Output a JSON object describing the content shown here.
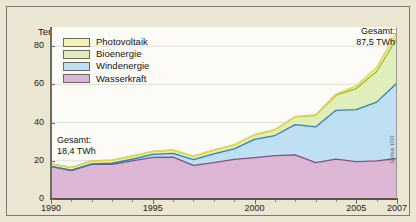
{
  "figure": {
    "axis_title": "Terawattstunden",
    "credit": "Globus 1093"
  },
  "legend": {
    "position": "top-left-inside",
    "items": [
      {
        "label": "Photovoltaik",
        "color": "#f4f2b0"
      },
      {
        "label": "Bioenergie",
        "color": "#e0eebb"
      },
      {
        "label": "Windenergie",
        "color": "#bfe0f2"
      },
      {
        "label": "Wasserkraft",
        "color": "#dcb6d4"
      }
    ]
  },
  "annotations": [
    {
      "name": "start-total",
      "text": "Gesamt:\n18,4 TWh",
      "year": 1990,
      "value": 18.4
    },
    {
      "name": "end-total",
      "text": "Gesamt:\n87,5 TWh",
      "year": 2007,
      "value": 87.5
    }
  ],
  "chart_data": {
    "type": "area",
    "stacked": true,
    "title": "",
    "subtitle": "",
    "xlabel": "",
    "ylabel": "Terawattstunden",
    "xlim": [
      1990,
      2007
    ],
    "ylim": [
      0,
      90
    ],
    "grid": true,
    "yticks": [
      0,
      20,
      40,
      60,
      80
    ],
    "xticks": [
      1990,
      1995,
      2000,
      2005,
      2007
    ],
    "x": [
      1990,
      1991,
      1992,
      1993,
      1994,
      1995,
      1996,
      1997,
      1998,
      1999,
      2000,
      2001,
      2002,
      2003,
      2004,
      2005,
      2006,
      2007
    ],
    "series": [
      {
        "name": "Wasserkraft",
        "color": "#dcb6d4",
        "line_color": "#8b4f7d",
        "values": [
          17.0,
          14.9,
          18.1,
          18.1,
          19.9,
          21.8,
          21.9,
          17.6,
          19.0,
          20.7,
          21.7,
          22.7,
          23.1,
          19.0,
          20.9,
          19.6,
          20.0,
          21.2
        ]
      },
      {
        "name": "Windenergie",
        "color": "#bfe0f2",
        "line_color": "#2f7fc0",
        "values": [
          0.1,
          0.2,
          0.3,
          0.6,
          0.9,
          1.5,
          2.0,
          3.0,
          4.6,
          5.5,
          9.5,
          10.5,
          15.8,
          18.7,
          25.5,
          27.2,
          30.7,
          39.5
        ]
      },
      {
        "name": "Bioenergie",
        "color": "#e0eebb",
        "line_color": "#8fbe3c",
        "values": [
          1.3,
          1.4,
          1.5,
          1.6,
          1.7,
          1.6,
          1.7,
          1.8,
          2.0,
          2.1,
          2.4,
          3.0,
          4.1,
          6.1,
          7.9,
          11.0,
          16.0,
          23.5
        ]
      },
      {
        "name": "Photovoltaik",
        "color": "#f4f2b0",
        "line_color": "#e3d94a",
        "values": [
          0.0,
          0.0,
          0.0,
          0.0,
          0.0,
          0.0,
          0.0,
          0.0,
          0.0,
          0.0,
          0.1,
          0.1,
          0.2,
          0.3,
          0.6,
          1.3,
          2.2,
          3.3
        ]
      }
    ],
    "totals": [
      18.4,
      16.5,
      19.9,
      20.3,
      22.5,
      24.9,
      25.6,
      22.4,
      25.6,
      28.3,
      33.7,
      36.3,
      43.2,
      44.1,
      54.9,
      59.1,
      68.9,
      87.5
    ]
  },
  "ticks": {
    "y": [
      "80",
      "60",
      "40",
      "20",
      "0"
    ],
    "x": [
      "1990",
      "1995",
      "2000",
      "2005",
      "2007"
    ]
  }
}
